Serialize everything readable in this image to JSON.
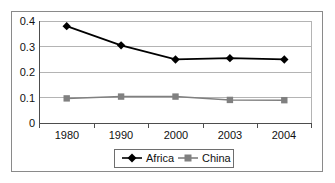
{
  "chart_data": {
    "type": "line",
    "title": "",
    "xlabel": "",
    "ylabel": "",
    "categories": [
      "1980",
      "1990",
      "2000",
      "2003",
      "2004"
    ],
    "series": [
      {
        "name": "Africa",
        "marker": "diamond",
        "color": "#000000",
        "values": [
          0.38,
          0.305,
          0.25,
          0.255,
          0.25
        ]
      },
      {
        "name": "China",
        "marker": "square",
        "color": "#808080",
        "values": [
          0.098,
          0.105,
          0.105,
          0.092,
          0.091
        ]
      }
    ],
    "ylim": [
      0,
      0.4
    ],
    "yticks": [
      0,
      0.1,
      0.2,
      0.3,
      0.4
    ],
    "ytick_labels": [
      "0",
      "0.1",
      "0.2",
      "0.3",
      "0.4"
    ],
    "grid": true,
    "legend_position": "bottom"
  },
  "legend": {
    "entries": [
      {
        "label": "Africa",
        "marker": "diamond-marker",
        "color": "#000000"
      },
      {
        "label": "China",
        "marker": "square-marker",
        "color": "#808080"
      }
    ]
  },
  "colors": {
    "africa": "#000000",
    "china": "#808080",
    "grid": "#b4b4b4",
    "axis": "#4d4d4d",
    "frame": "#8a8a8a",
    "background": "#ffffff"
  }
}
